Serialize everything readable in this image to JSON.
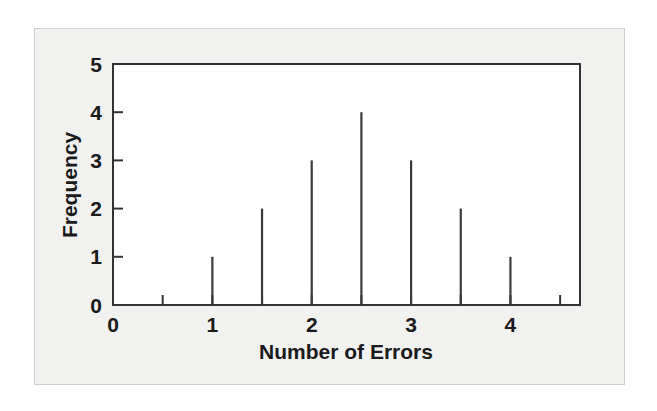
{
  "figure": {
    "background_color": "#ffffff",
    "panel_color": "#f1f1f0",
    "panel_border_color": "#cfcfcf",
    "axis_color": "#333333",
    "spike_color": "#3a3a3a"
  },
  "chart_data": {
    "type": "bar",
    "title": "",
    "subtitle": "",
    "xlabel": "Number of Errors",
    "ylabel": "Frequency",
    "categories": [
      "1",
      "1.5",
      "2",
      "2.5",
      "3",
      "3.5",
      "4"
    ],
    "x": [
      1,
      1.5,
      2,
      2.5,
      3,
      3.5,
      4
    ],
    "values": [
      1,
      2,
      3,
      4,
      3,
      2,
      1
    ],
    "xlim": [
      0,
      4.7
    ],
    "ylim": [
      0,
      5
    ],
    "x_tick_labels": [
      "0",
      "1",
      "2",
      "3",
      "4"
    ],
    "x_tick_values": [
      0,
      1,
      2,
      3,
      4
    ],
    "x_minor_tick_values": [
      0.5,
      1.5,
      2.5,
      3.5,
      4.5
    ],
    "y_tick_labels": [
      "0",
      "1",
      "2",
      "3",
      "4",
      "5"
    ],
    "y_tick_values": [
      0,
      1,
      2,
      3,
      4,
      5
    ],
    "grid": false,
    "legend": false,
    "legend_position": "none",
    "annotations": []
  }
}
